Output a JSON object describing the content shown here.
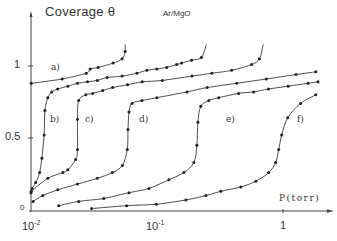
{
  "chart_data": {
    "type": "line",
    "title": "Coverage θ",
    "subtitle": "Ar/MgO",
    "xlabel": "P(torr)",
    "ylabel": "Coverage θ",
    "xscale": "log",
    "xlim": [
      0.01,
      2.3
    ],
    "ylim": [
      0,
      1.2
    ],
    "grid": false,
    "legend": "inline curve labels",
    "x_ticks": [
      {
        "value": 0.01,
        "label": "10⁻²"
      },
      {
        "value": 0.1,
        "label": "10⁻¹"
      },
      {
        "value": 1,
        "label": "1"
      }
    ],
    "y_ticks": [
      {
        "value": 0,
        "label": "0"
      },
      {
        "value": 0.5,
        "label": "0.5"
      },
      {
        "value": 1,
        "label": "1"
      }
    ],
    "series": [
      {
        "name": "a)",
        "label_pos": [
          0.0197,
          0.94
        ],
        "points": [
          [
            0.01004,
            0.88
          ],
          [
            0.0177,
            0.91
          ],
          [
            0.0274,
            0.95
          ],
          [
            0.0295,
            0.98
          ],
          [
            0.0341,
            0.99
          ],
          [
            0.0448,
            1.02
          ],
          [
            0.0528,
            1.05
          ],
          [
            0.0558,
            1.1
          ],
          [
            0.0558,
            1.15
          ]
        ]
      },
      {
        "name": "b)",
        "label_pos": [
          0.0134,
          0.5
        ],
        "points": [
          [
            0.01,
            0.12
          ],
          [
            0.0102,
            0.15
          ],
          [
            0.0109,
            0.19
          ],
          [
            0.0117,
            0.26
          ],
          [
            0.0122,
            0.36
          ],
          [
            0.0127,
            0.52
          ],
          [
            0.0129,
            0.69
          ],
          [
            0.0136,
            0.78
          ],
          [
            0.0146,
            0.82
          ],
          [
            0.0163,
            0.84
          ],
          [
            0.0196,
            0.86
          ],
          [
            0.0234,
            0.88
          ],
          [
            0.0281,
            0.89
          ],
          [
            0.0336,
            0.9
          ],
          [
            0.0402,
            0.92
          ],
          [
            0.0528,
            0.93
          ],
          [
            0.0692,
            0.95
          ],
          [
            0.0831,
            0.97
          ],
          [
            0.0996,
            0.98
          ],
          [
            0.1194,
            0.99
          ],
          [
            0.1431,
            1.01
          ],
          [
            0.1567,
            1.02
          ],
          [
            0.1879,
            1.04
          ],
          [
            0.2252,
            1.06
          ],
          [
            0.2467,
            1.15
          ]
        ]
      },
      {
        "name": "c)",
        "label_pos": [
          0.0281,
          0.5
        ],
        "points": [
          [
            0.01004,
            0.13
          ],
          [
            0.0136,
            0.22
          ],
          [
            0.0179,
            0.26
          ],
          [
            0.0196,
            0.28
          ],
          [
            0.0226,
            0.35
          ],
          [
            0.0234,
            0.42
          ],
          [
            0.0234,
            0.63
          ],
          [
            0.0239,
            0.76
          ],
          [
            0.0272,
            0.8
          ],
          [
            0.0309,
            0.81
          ],
          [
            0.0371,
            0.83
          ],
          [
            0.0444,
            0.85
          ],
          [
            0.0583,
            0.87
          ],
          [
            0.0763,
            0.89
          ],
          [
            0.1101,
            0.9
          ],
          [
            0.1897,
            0.93
          ],
          [
            0.2725,
            0.95
          ],
          [
            0.3916,
            0.97
          ],
          [
            0.5626,
            1.01
          ],
          [
            0.6498,
            1.05
          ],
          [
            0.6975,
            1.15
          ]
        ]
      },
      {
        "name": "d)",
        "label_pos": [
          0.0649,
          0.5
        ],
        "points": [
          [
            0.0104,
            0.06
          ],
          [
            0.0124,
            0.1
          ],
          [
            0.0163,
            0.14
          ],
          [
            0.0234,
            0.18
          ],
          [
            0.0336,
            0.22
          ],
          [
            0.0442,
            0.26
          ],
          [
            0.0531,
            0.31
          ],
          [
            0.0581,
            0.42
          ],
          [
            0.0589,
            0.56
          ],
          [
            0.06,
            0.68
          ],
          [
            0.0633,
            0.74
          ],
          [
            0.076,
            0.76
          ],
          [
            0.0999,
            0.78
          ],
          [
            0.1731,
            0.82
          ],
          [
            0.2497,
            0.85
          ],
          [
            0.4291,
            0.88
          ],
          [
            0.7375,
            0.91
          ],
          [
            1.2676,
            0.94
          ],
          [
            1.8213,
            0.96
          ]
        ]
      },
      {
        "name": "e)",
        "label_pos": [
          0.2935,
          0.5
        ],
        "points": [
          [
            0.0166,
            0.03
          ],
          [
            0.0239,
            0.06
          ],
          [
            0.0378,
            0.08
          ],
          [
            0.0599,
            0.12
          ],
          [
            0.0862,
            0.15
          ],
          [
            0.1243,
            0.21
          ],
          [
            0.1635,
            0.26
          ],
          [
            0.1962,
            0.33
          ],
          [
            0.2072,
            0.45
          ],
          [
            0.211,
            0.61
          ],
          [
            0.2228,
            0.72
          ],
          [
            0.2576,
            0.76
          ],
          [
            0.3094,
            0.78
          ],
          [
            0.4446,
            0.81
          ],
          [
            0.5846,
            0.82
          ],
          [
            0.7677,
            0.84
          ],
          [
            1.1001,
            0.86
          ],
          [
            1.5788,
            0.88
          ],
          [
            1.8942,
            0.89
          ]
        ]
      },
      {
        "name": "f)",
        "label_pos": [
          1.1,
          0.5
        ],
        "points": [
          [
            0.0302,
            0.01
          ],
          [
            0.0574,
            0.03
          ],
          [
            0.0988,
            0.04
          ],
          [
            0.17,
            0.07
          ],
          [
            0.2446,
            0.1
          ],
          [
            0.3211,
            0.13
          ],
          [
            0.4629,
            0.16
          ],
          [
            0.6087,
            0.2
          ],
          [
            0.7702,
            0.26
          ],
          [
            0.875,
            0.33
          ],
          [
            0.9244,
            0.42
          ],
          [
            0.9758,
            0.52
          ],
          [
            1.0894,
            0.64
          ],
          [
            1.3802,
            0.74
          ],
          [
            1.8213,
            0.8
          ]
        ]
      }
    ]
  },
  "annotations": {
    "title": "Coverage θ",
    "subtitle": "Ar/MgO",
    "xlabel": "P(torr)",
    "y_tick_0": "0",
    "y_tick_05": "0.5",
    "y_tick_1": "1",
    "x_tick_base": "10",
    "x_tick_exp_m2": "-2",
    "x_tick_exp_m1": "-1",
    "x_tick_1": "1",
    "curve_labels": [
      "a)",
      "b)",
      "c)",
      "d)",
      "e)",
      "f)"
    ]
  },
  "style": {
    "line_color": "#3a3a3a",
    "marker_color": "#222222",
    "axis_color": "#444444"
  }
}
